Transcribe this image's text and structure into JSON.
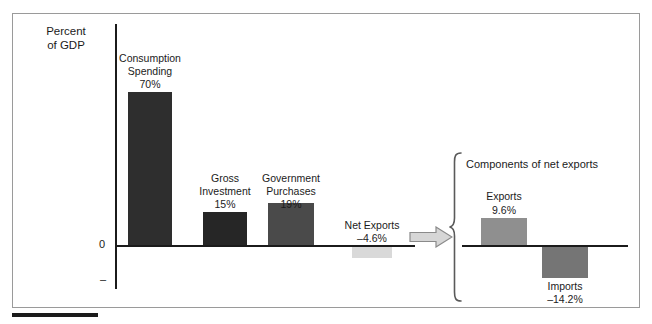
{
  "figure": {
    "axis_title": "Percent\nof GDP",
    "zero_tick": "0",
    "negative_tick": "–"
  },
  "inset": {
    "title": "Components of net exports"
  },
  "icons": {
    "arrow": "right-arrow-icon",
    "brace": "curly-brace-icon"
  },
  "colors": {
    "consumption": "#2e2e2e",
    "investment": "#262626",
    "government": "#4a4a4a",
    "net_exports": "#d9d9d9",
    "exports": "#8f8f8f",
    "imports": "#757575",
    "axis": "#1b1b1b",
    "frame": "#9a9a9a"
  },
  "chart_data": {
    "type": "bar",
    "title": "",
    "subtitle": "",
    "xlabel": "",
    "ylabel": "Percent of GDP",
    "grid": false,
    "legend": "none",
    "ylim": [
      -20,
      75
    ],
    "categories": [
      "Consumption Spending",
      "Gross Investment",
      "Government Purchases",
      "Net Exports"
    ],
    "values": [
      70,
      15,
      19,
      -4.6
    ],
    "value_labels": [
      "70%",
      "15%",
      "19%",
      "–4.6%"
    ],
    "category_labels": [
      "Consumption\nSpending",
      "Gross\nInvestment",
      "Government\nPurchases",
      "Net Exports"
    ],
    "inset_chart": {
      "type": "bar",
      "title": "Components of net exports",
      "categories": [
        "Exports",
        "Imports"
      ],
      "values": [
        9.6,
        -14.2
      ],
      "value_labels": [
        "9.6%",
        "–14.2%"
      ],
      "category_labels": [
        "Exports",
        "Imports"
      ],
      "ylim": [
        -20,
        20
      ]
    }
  },
  "bars": [
    {
      "name": "consumption-spending",
      "label": "Consumption\nSpending",
      "value_label": "70%",
      "color": "#2e2e2e",
      "left": 128,
      "top": 92,
      "width": 44,
      "height": 153,
      "label_left": 112,
      "label_top": 52,
      "value_left": 112,
      "value_top": 78,
      "label_width": 76
    },
    {
      "name": "gross-investment",
      "label": "Gross\nInvestment",
      "value_label": "15%",
      "color": "#262626",
      "left": 203,
      "top": 212,
      "width": 44,
      "height": 33,
      "label_left": 186,
      "label_top": 172,
      "value_left": 186,
      "value_top": 198,
      "label_width": 78
    },
    {
      "name": "government-purchases",
      "label": "Government\nPurchases",
      "value_label": "19%",
      "color": "#4a4a4a",
      "left": 268,
      "top": 203,
      "width": 46,
      "height": 42,
      "label_left": 250,
      "label_top": 172,
      "value_left": 250,
      "value_top": 198,
      "label_width": 82
    },
    {
      "name": "net-exports",
      "label": "Net Exports",
      "value_label": "–4.6%",
      "color": "#d9d9d9",
      "left": 352,
      "top": 247,
      "width": 40,
      "height": 11,
      "label_left": 332,
      "label_top": 219,
      "value_left": 332,
      "value_top": 232,
      "label_width": 80
    }
  ],
  "inset_bars": [
    {
      "name": "exports",
      "label": "Exports",
      "value_label": "9.6%",
      "color": "#8f8f8f",
      "left": 481,
      "top": 218,
      "width": 46,
      "height": 27,
      "label_left": 468,
      "label_top": 190,
      "value_left": 468,
      "value_top": 204,
      "label_width": 72
    },
    {
      "name": "imports",
      "label": "Imports",
      "value_label": "–14.2%",
      "color": "#757575",
      "left": 542,
      "top": 247,
      "width": 46,
      "height": 31,
      "label_left": 529,
      "label_top": 280,
      "value_left": 529,
      "value_top": 293,
      "label_width": 72
    }
  ]
}
